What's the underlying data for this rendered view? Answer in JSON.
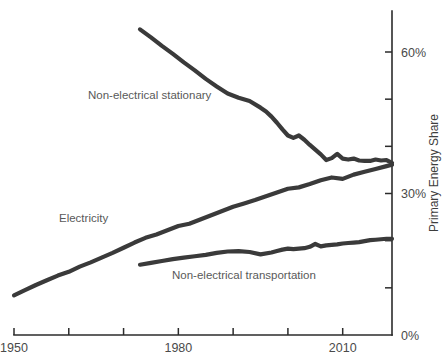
{
  "chart_data": {
    "type": "line",
    "title": "",
    "subtitle": "",
    "xlabel": "",
    "ylabel": "Primary Energy Share",
    "xlim": [
      1950,
      2019
    ],
    "ylim": [
      0,
      70
    ],
    "grid": false,
    "legend_position": "inline-annotations",
    "x_ticks": [
      1950,
      1960,
      1970,
      1980,
      1990,
      2000,
      2010
    ],
    "x_tick_labels": [
      "1950",
      "",
      "",
      "1980",
      "",
      "",
      "2010"
    ],
    "y_ticks": [
      0,
      10,
      20,
      30,
      40,
      50,
      60
    ],
    "y_tick_labels": [
      "0%",
      "",
      "",
      "30%",
      "",
      "",
      "60%"
    ],
    "y_axis_side": "right",
    "line_color": "#3a3a3a",
    "axis_color": "#2b2b2b",
    "label_color": "#595959",
    "series": [
      {
        "name": "Non-electrical stationary",
        "label": "Non-electrical stationary",
        "x": [
          1973,
          1975,
          1977,
          1979,
          1981,
          1983,
          1985,
          1987,
          1989,
          1991,
          1993,
          1995,
          1996,
          1997,
          1998,
          1999,
          2000,
          2001,
          2002,
          2003,
          2004,
          2005,
          2006,
          2007,
          2008,
          2009,
          2010,
          2011,
          2012,
          2013,
          2014,
          2015,
          2016,
          2017,
          2018,
          2019
        ],
        "values": [
          64.8,
          63.1,
          61.3,
          59.6,
          57.8,
          56.1,
          54.3,
          52.7,
          51.2,
          50.3,
          49.6,
          48.2,
          47.4,
          46.3,
          45.0,
          43.6,
          42.3,
          41.8,
          42.3,
          41.4,
          40.3,
          39.3,
          38.3,
          37.1,
          37.5,
          38.4,
          37.4,
          37.2,
          37.4,
          37.0,
          36.9,
          36.9,
          37.2,
          37.0,
          37.1,
          36.5
        ]
      },
      {
        "name": "Electricity",
        "label": "Electricity",
        "x": [
          1950,
          1952,
          1954,
          1956,
          1958,
          1960,
          1962,
          1964,
          1966,
          1968,
          1970,
          1972,
          1974,
          1976,
          1978,
          1980,
          1982,
          1984,
          1986,
          1988,
          1990,
          1992,
          1994,
          1996,
          1998,
          2000,
          2002,
          2004,
          2006,
          2008,
          2010,
          2012,
          2014,
          2016,
          2018,
          2019
        ],
        "values": [
          8.4,
          9.5,
          10.6,
          11.6,
          12.6,
          13.4,
          14.5,
          15.4,
          16.4,
          17.4,
          18.5,
          19.6,
          20.6,
          21.3,
          22.2,
          23.1,
          23.6,
          24.5,
          25.4,
          26.3,
          27.2,
          27.9,
          28.6,
          29.4,
          30.2,
          31.0,
          31.3,
          32.0,
          32.8,
          33.4,
          33.1,
          34.0,
          34.6,
          35.2,
          35.8,
          36.1
        ]
      },
      {
        "name": "Non-electrical transportation",
        "label": "Non-electrical transportation",
        "x": [
          1973,
          1975,
          1977,
          1979,
          1981,
          1983,
          1985,
          1987,
          1989,
          1991,
          1993,
          1995,
          1997,
          1998,
          1999,
          2000,
          2001,
          2002,
          2003,
          2004,
          2005,
          2006,
          2007,
          2008,
          2009,
          2010,
          2011,
          2012,
          2013,
          2014,
          2015,
          2016,
          2017,
          2018,
          2019
        ],
        "values": [
          14.9,
          15.3,
          15.7,
          16.1,
          16.4,
          16.7,
          17.0,
          17.4,
          17.7,
          17.8,
          17.6,
          17.1,
          17.5,
          17.8,
          18.1,
          18.3,
          18.2,
          18.3,
          18.4,
          18.7,
          19.3,
          18.8,
          19.0,
          19.1,
          19.2,
          19.4,
          19.5,
          19.6,
          19.7,
          19.9,
          20.1,
          20.2,
          20.3,
          20.4,
          20.4
        ]
      }
    ],
    "annotations": [
      {
        "text": "Non-electrical stationary",
        "x_px": 88,
        "y_px": 99
      },
      {
        "text": "Electricity",
        "x_px": 59,
        "y_px": 222
      },
      {
        "text": "Non-electrical transportation",
        "x_px": 172,
        "y_px": 279
      }
    ]
  }
}
